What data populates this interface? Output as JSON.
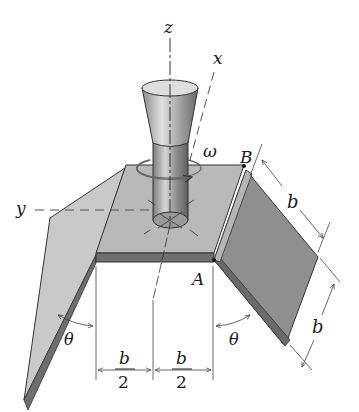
{
  "figure": {
    "labels": {
      "z_axis": "z",
      "x_axis": "x",
      "y_axis": "y",
      "omega": "ω",
      "point_A": "A",
      "point_B": "B",
      "theta_left": "θ",
      "theta_right": "θ",
      "b_upper": "b",
      "b_lower": "b",
      "half_left_num": "b",
      "half_left_den": "2",
      "half_right_num": "b",
      "half_right_den": "2"
    },
    "colors": {
      "plate_top": "#b9b9b9",
      "plate_edge": "#6e6e6e",
      "flap_left": "#c8c8c8",
      "flap_right": "#8f8f8f",
      "shaft": "#a9a9a9",
      "cap_top": "#dedede",
      "line": "#333333"
    }
  }
}
